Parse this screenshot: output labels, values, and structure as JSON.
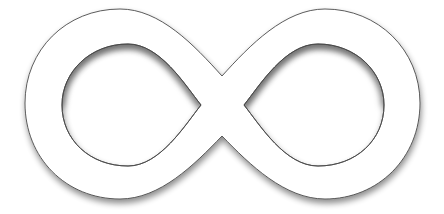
{
  "image": {
    "subject": "infinity-symbol",
    "background_color": "#ffffff",
    "fill_color": "#ffffff",
    "outline_color": "#4a4a4a",
    "shadow_color": "#000000"
  }
}
